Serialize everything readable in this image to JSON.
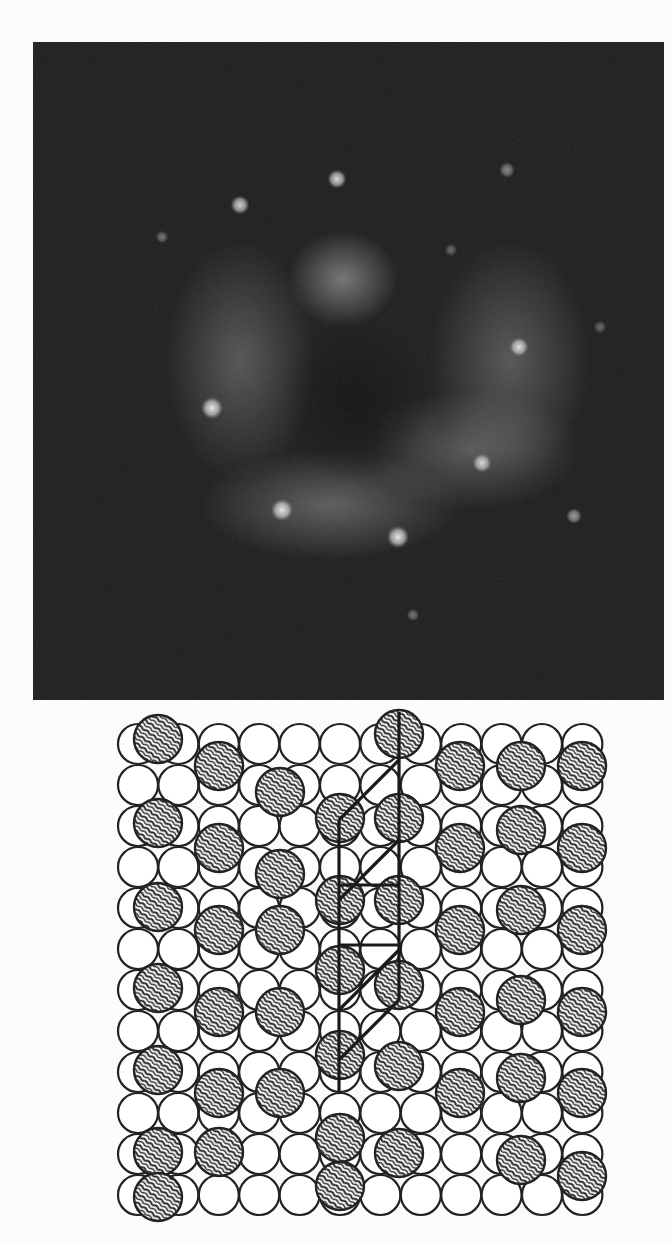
{
  "figure": {
    "leed_pattern": {
      "description": "LEED diffraction pattern",
      "background_color": "#1a1a1a",
      "spot_color": "#e8e8e8",
      "spots": [
        {
          "x": 337,
          "y": 179,
          "r": 6,
          "intensity": 0.9
        },
        {
          "x": 240,
          "y": 205,
          "r": 6,
          "intensity": 0.85
        },
        {
          "x": 212,
          "y": 408,
          "r": 7,
          "intensity": 0.95
        },
        {
          "x": 519,
          "y": 347,
          "r": 6,
          "intensity": 0.9
        },
        {
          "x": 482,
          "y": 463,
          "r": 6,
          "intensity": 0.85
        },
        {
          "x": 282,
          "y": 510,
          "r": 7,
          "intensity": 0.95
        },
        {
          "x": 398,
          "y": 537,
          "r": 7,
          "intensity": 0.95
        },
        {
          "x": 574,
          "y": 516,
          "r": 5,
          "intensity": 0.6
        },
        {
          "x": 507,
          "y": 170,
          "r": 5,
          "intensity": 0.5
        },
        {
          "x": 162,
          "y": 237,
          "r": 4,
          "intensity": 0.4
        },
        {
          "x": 451,
          "y": 250,
          "r": 4,
          "intensity": 0.35
        },
        {
          "x": 413,
          "y": 615,
          "r": 4,
          "intensity": 0.4
        },
        {
          "x": 600,
          "y": 327,
          "r": 4,
          "intensity": 0.35
        }
      ],
      "diffuse_bands": [
        {
          "cx": 343,
          "cy": 279,
          "rx": 55,
          "ry": 48,
          "opacity": 0.55
        },
        {
          "cx": 240,
          "cy": 360,
          "rx": 75,
          "ry": 120,
          "opacity": 0.35
        },
        {
          "cx": 510,
          "cy": 360,
          "rx": 80,
          "ry": 120,
          "opacity": 0.35
        },
        {
          "cx": 330,
          "cy": 505,
          "rx": 130,
          "ry": 55,
          "opacity": 0.4
        },
        {
          "cx": 470,
          "cy": 450,
          "rx": 110,
          "ry": 60,
          "opacity": 0.35
        }
      ],
      "dark_center": {
        "cx": 355,
        "cy": 400,
        "rx": 75,
        "ry": 85
      }
    },
    "lattice_model": {
      "description": "Real-space structural model: substrate atoms (white circles) with hatched adsorbate atoms and unit cell outline",
      "substrate": {
        "cols": 12,
        "rows": 12,
        "x0": 138,
        "y0": 744,
        "pitch_x": 40.4,
        "pitch_y": 41.0,
        "radius": 20,
        "fill": "#ffffff",
        "stroke": "#222222"
      },
      "adsorbate": {
        "radius": 24,
        "fill": "#555555",
        "stroke": "#222222",
        "positions": [
          [
            158,
            739
          ],
          [
            219,
            766
          ],
          [
            280,
            792
          ],
          [
            340,
            818
          ],
          [
            399,
            734
          ],
          [
            460,
            766
          ],
          [
            521,
            766
          ],
          [
            582,
            766
          ],
          [
            158,
            823
          ],
          [
            219,
            848
          ],
          [
            280,
            874
          ],
          [
            340,
            900
          ],
          [
            399,
            818
          ],
          [
            460,
            848
          ],
          [
            521,
            830
          ],
          [
            582,
            848
          ],
          [
            158,
            907
          ],
          [
            219,
            930
          ],
          [
            280,
            930
          ],
          [
            340,
            970
          ],
          [
            399,
            900
          ],
          [
            460,
            930
          ],
          [
            521,
            910
          ],
          [
            582,
            930
          ],
          [
            158,
            988
          ],
          [
            219,
            1012
          ],
          [
            280,
            1012
          ],
          [
            340,
            1055
          ],
          [
            399,
            985
          ],
          [
            460,
            1012
          ],
          [
            521,
            1000
          ],
          [
            582,
            1012
          ],
          [
            158,
            1070
          ],
          [
            219,
            1093
          ],
          [
            280,
            1093
          ],
          [
            340,
            1138
          ],
          [
            399,
            1066
          ],
          [
            460,
            1093
          ],
          [
            521,
            1078
          ],
          [
            582,
            1093
          ],
          [
            158,
            1152
          ],
          [
            219,
            1152
          ],
          [
            399,
            1153
          ],
          [
            521,
            1160
          ],
          [
            582,
            1176
          ],
          [
            340,
            1186
          ],
          [
            158,
            1197
          ]
        ]
      },
      "unit_cell_lines": [
        [
          [
            399,
            712
          ],
          [
            399,
            1000
          ]
        ],
        [
          [
            339,
            820
          ],
          [
            339,
            1092
          ]
        ],
        [
          [
            339,
            885
          ],
          [
            399,
            885
          ]
        ],
        [
          [
            339,
            945
          ],
          [
            399,
            945
          ]
        ],
        [
          [
            399,
            760
          ],
          [
            339,
            820
          ]
        ],
        [
          [
            399,
            840
          ],
          [
            339,
            900
          ]
        ],
        [
          [
            399,
            950
          ],
          [
            339,
            1010
          ]
        ],
        [
          [
            399,
            1000
          ],
          [
            339,
            1060
          ]
        ]
      ],
      "line_color": "#1a1a1a"
    }
  }
}
